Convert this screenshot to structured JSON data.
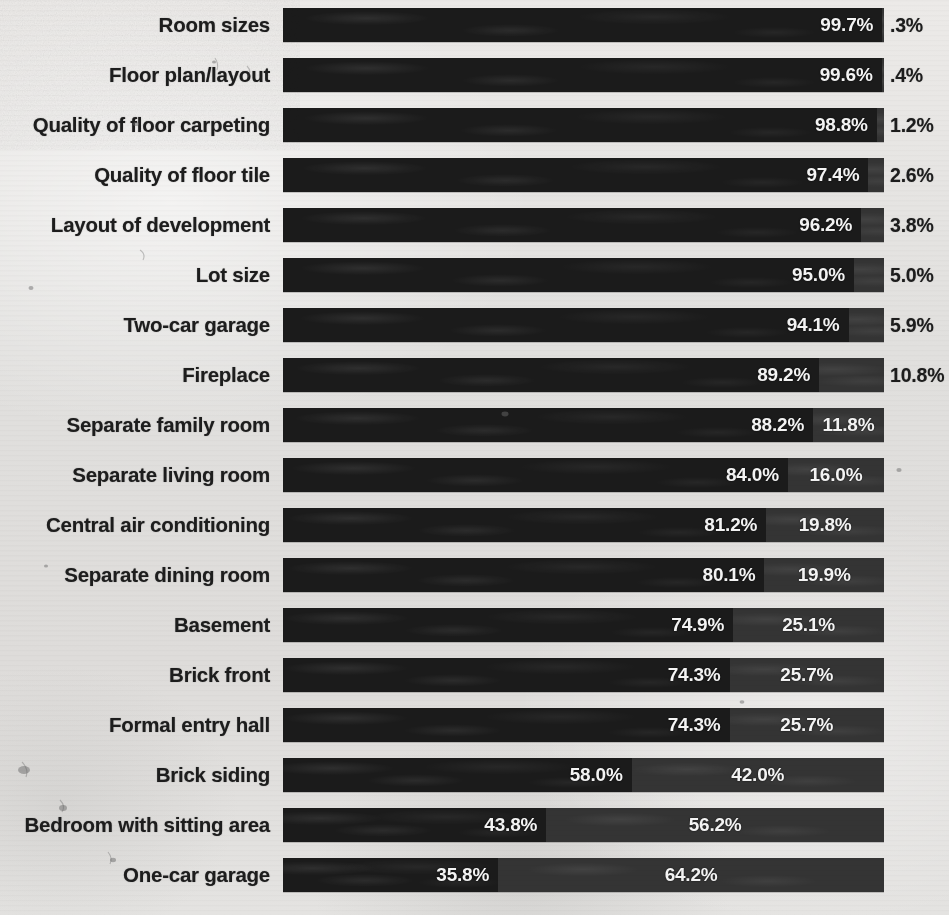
{
  "chart_data": {
    "type": "bar",
    "subtype": "horizontal-100-percent-stacked",
    "title": "",
    "subtitle": "",
    "xlabel": "",
    "ylabel": "",
    "xlim": [
      0,
      100
    ],
    "grid": false,
    "legend_position": "none",
    "categories": [
      "Room sizes",
      "Floor plan/layout",
      "Quality of floor carpeting",
      "Quality of floor tile",
      "Layout of development",
      "Lot size",
      "Two-car garage",
      "Fireplace",
      "Separate family room",
      "Separate living room",
      "Central air conditioning",
      "Separate dining room",
      "Basement",
      "Brick front",
      "Formal entry hall",
      "Brick siding",
      "Bedroom with sitting area",
      "One-car garage"
    ],
    "series": [
      {
        "name": "Primary segment",
        "color": "#1b1b1b",
        "values": [
          99.7,
          99.6,
          98.8,
          97.4,
          96.2,
          95.0,
          94.1,
          89.2,
          88.2,
          84.0,
          81.2,
          80.1,
          74.9,
          74.3,
          74.3,
          58.0,
          43.8,
          35.8
        ]
      },
      {
        "name": "Secondary segment",
        "color": "#343434",
        "values": [
          0.3,
          0.4,
          1.2,
          2.6,
          3.8,
          5.0,
          5.9,
          10.8,
          11.8,
          16.0,
          19.8,
          19.9,
          25.1,
          25.7,
          25.7,
          42.0,
          56.2,
          64.2
        ]
      }
    ]
  },
  "rows": [
    {
      "label": "Room sizes",
      "a": 99.7,
      "b": 0.3,
      "a_text": "99.7%",
      "b_text": ".3%",
      "b_outside": true
    },
    {
      "label": "Floor plan/layout",
      "a": 99.6,
      "b": 0.4,
      "a_text": "99.6%",
      "b_text": ".4%",
      "b_outside": true
    },
    {
      "label": "Quality of floor carpeting",
      "a": 98.8,
      "b": 1.2,
      "a_text": "98.8%",
      "b_text": "1.2%",
      "b_outside": true
    },
    {
      "label": "Quality of floor tile",
      "a": 97.4,
      "b": 2.6,
      "a_text": "97.4%",
      "b_text": "2.6%",
      "b_outside": true
    },
    {
      "label": "Layout of development",
      "a": 96.2,
      "b": 3.8,
      "a_text": "96.2%",
      "b_text": "3.8%",
      "b_outside": true
    },
    {
      "label": "Lot size",
      "a": 95.0,
      "b": 5.0,
      "a_text": "95.0%",
      "b_text": "5.0%",
      "b_outside": true
    },
    {
      "label": "Two-car garage",
      "a": 94.1,
      "b": 5.9,
      "a_text": "94.1%",
      "b_text": "5.9%",
      "b_outside": true
    },
    {
      "label": "Fireplace",
      "a": 89.2,
      "b": 10.8,
      "a_text": "89.2%",
      "b_text": "10.8%",
      "b_outside": true
    },
    {
      "label": "Separate family room",
      "a": 88.2,
      "b": 11.8,
      "a_text": "88.2%",
      "b_text": "11.8%",
      "b_outside": false
    },
    {
      "label": "Separate living room",
      "a": 84.0,
      "b": 16.0,
      "a_text": "84.0%",
      "b_text": "16.0%",
      "b_outside": false
    },
    {
      "label": "Central air conditioning",
      "a": 81.2,
      "b": 19.8,
      "a_text": "81.2%",
      "b_text": "19.8%",
      "b_outside": false
    },
    {
      "label": "Separate dining room",
      "a": 80.1,
      "b": 19.9,
      "a_text": "80.1%",
      "b_text": "19.9%",
      "b_outside": false
    },
    {
      "label": "Basement",
      "a": 74.9,
      "b": 25.1,
      "a_text": "74.9%",
      "b_text": "25.1%",
      "b_outside": false
    },
    {
      "label": "Brick front",
      "a": 74.3,
      "b": 25.7,
      "a_text": "74.3%",
      "b_text": "25.7%",
      "b_outside": false
    },
    {
      "label": "Formal entry hall",
      "a": 74.3,
      "b": 25.7,
      "a_text": "74.3%",
      "b_text": "25.7%",
      "b_outside": false
    },
    {
      "label": "Brick siding",
      "a": 58.0,
      "b": 42.0,
      "a_text": "58.0%",
      "b_text": "42.0%",
      "b_outside": false
    },
    {
      "label": "Bedroom with sitting area",
      "a": 43.8,
      "b": 56.2,
      "a_text": "43.8%",
      "b_text": "56.2%",
      "b_outside": false
    },
    {
      "label": "One-car garage",
      "a": 35.8,
      "b": 64.2,
      "a_text": "35.8%",
      "b_text": "64.2%",
      "b_outside": false
    }
  ],
  "colors": {
    "segment_primary": "#1b1b1b",
    "segment_secondary": "#343434",
    "paper_background": "#e3e2e0",
    "label_text": "#1d1d1d",
    "value_text_on_bar": "#f4f4f4"
  },
  "geometry": {
    "bar_left_px": 283,
    "bar_width_px": 601,
    "row_pitch_px": 50,
    "bar_height_px": 34,
    "first_row_top_px": 8
  }
}
